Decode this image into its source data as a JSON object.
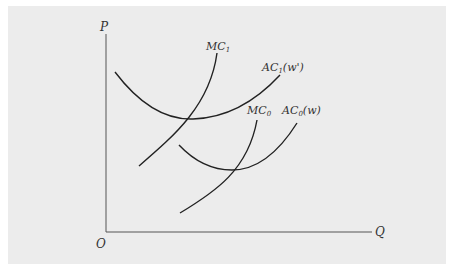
{
  "figure": {
    "type": "cost-curves-diagram",
    "axes": {
      "y_label": "P",
      "x_label": "Q",
      "origin_label": "O"
    },
    "curves": [
      {
        "id": "MC1",
        "label_main": "MC",
        "label_sub": "1",
        "label_suffix": "",
        "kind": "marginal-cost",
        "wage": "w'"
      },
      {
        "id": "AC1",
        "label_main": "AC",
        "label_sub": "1",
        "label_suffix": "(w')",
        "kind": "average-cost",
        "wage": "w'"
      },
      {
        "id": "MC0",
        "label_main": "MC",
        "label_sub": "0",
        "label_suffix": "",
        "kind": "marginal-cost",
        "wage": "w"
      },
      {
        "id": "AC0",
        "label_main": "AC",
        "label_sub": "0",
        "label_suffix": "(w)",
        "kind": "average-cost",
        "wage": "w"
      }
    ]
  }
}
